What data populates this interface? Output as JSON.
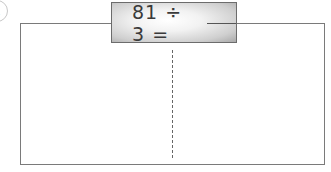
{
  "problem": {
    "number_label": "1",
    "expression": "81 ÷ 3 =",
    "answer": ""
  },
  "work_area": {
    "divider": "dashed-vertical"
  }
}
